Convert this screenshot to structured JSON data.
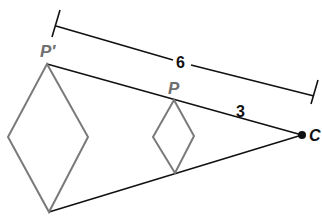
{
  "diagram": {
    "type": "dilation",
    "labels": {
      "image_point": "P′",
      "preimage_point": "P",
      "center": "C",
      "full_distance": "6",
      "partial_distance": "3"
    },
    "colors": {
      "lines": "#111111",
      "shapes": "#7a7a7a",
      "labels_gray": "#6f6f6f"
    }
  }
}
